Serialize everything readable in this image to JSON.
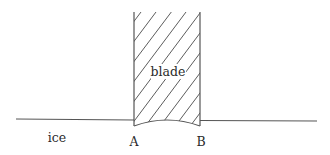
{
  "diagram": {
    "labels": {
      "blade": "blade",
      "ice": "ice",
      "point_a": "A",
      "point_b": "B"
    },
    "colors": {
      "stroke": "#555555",
      "hatch": "#4a4a4a",
      "text": "#2a2a2a",
      "background": "#ffffff"
    }
  }
}
